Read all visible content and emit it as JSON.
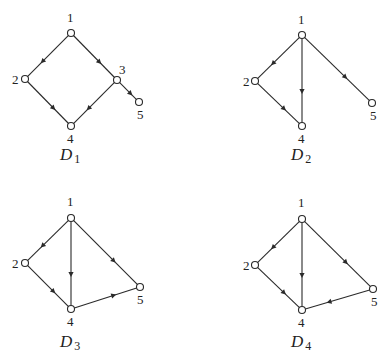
{
  "diagrams": [
    {
      "id": "D1",
      "title": "D",
      "subscript": "1",
      "title_pos": [
        60,
        160
      ],
      "nodes": [
        {
          "label": "1",
          "x": 71,
          "y": 33,
          "lx": 67,
          "ly": 22
        },
        {
          "label": "2",
          "x": 25,
          "y": 79,
          "lx": 12,
          "ly": 84
        },
        {
          "label": "3",
          "x": 117,
          "y": 80,
          "lx": 119,
          "ly": 74
        },
        {
          "label": "4",
          "x": 71,
          "y": 126,
          "lx": 67,
          "ly": 143
        },
        {
          "label": "5",
          "x": 139,
          "y": 102,
          "lx": 137,
          "ly": 119
        }
      ],
      "edges": [
        [
          "1",
          "2"
        ],
        [
          "1",
          "3"
        ],
        [
          "2",
          "4"
        ],
        [
          "3",
          "4"
        ],
        [
          "3",
          "5"
        ]
      ]
    },
    {
      "id": "D2",
      "title": "D",
      "subscript": "2",
      "title_pos": [
        291,
        160
      ],
      "nodes": [
        {
          "label": "1",
          "x": 302,
          "y": 35,
          "lx": 298,
          "ly": 24
        },
        {
          "label": "2",
          "x": 255,
          "y": 81,
          "lx": 243,
          "ly": 86
        },
        {
          "label": "4",
          "x": 302,
          "y": 126,
          "lx": 298,
          "ly": 143
        },
        {
          "label": "5",
          "x": 372,
          "y": 103,
          "lx": 370,
          "ly": 120
        }
      ],
      "edges": [
        [
          "1",
          "2"
        ],
        [
          "1",
          "4"
        ],
        [
          "1",
          "5"
        ],
        [
          "2",
          "4"
        ]
      ]
    },
    {
      "id": "D3",
      "title": "D",
      "subscript": "3",
      "title_pos": [
        60,
        347
      ],
      "nodes": [
        {
          "label": "1",
          "x": 71,
          "y": 218,
          "lx": 67,
          "ly": 206
        },
        {
          "label": "2",
          "x": 25,
          "y": 263,
          "lx": 12,
          "ly": 268
        },
        {
          "label": "4",
          "x": 71,
          "y": 309,
          "lx": 67,
          "ly": 326
        },
        {
          "label": "5",
          "x": 140,
          "y": 287,
          "lx": 137,
          "ly": 304
        }
      ],
      "edges": [
        [
          "1",
          "2"
        ],
        [
          "1",
          "4"
        ],
        [
          "1",
          "5"
        ],
        [
          "2",
          "4"
        ],
        [
          "4",
          "5"
        ]
      ]
    },
    {
      "id": "D4",
      "title": "D",
      "subscript": "4",
      "title_pos": [
        291,
        347
      ],
      "nodes": [
        {
          "label": "1",
          "x": 302,
          "y": 219,
          "lx": 298,
          "ly": 207
        },
        {
          "label": "2",
          "x": 255,
          "y": 265,
          "lx": 243,
          "ly": 270
        },
        {
          "label": "4",
          "x": 302,
          "y": 310,
          "lx": 298,
          "ly": 327
        },
        {
          "label": "5",
          "x": 373,
          "y": 289,
          "lx": 371,
          "ly": 306
        }
      ],
      "edges": [
        [
          "1",
          "2"
        ],
        [
          "1",
          "4"
        ],
        [
          "1",
          "5"
        ],
        [
          "2",
          "4"
        ],
        [
          "5",
          "4"
        ]
      ]
    }
  ]
}
